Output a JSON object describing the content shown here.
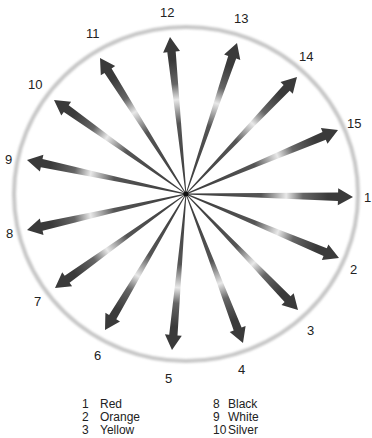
{
  "diagram": {
    "type": "radial-arrow-wheel",
    "center": [
      186,
      194
    ],
    "circle": {
      "rx": 172,
      "ry": 167,
      "stroke": "#c8c8c8"
    },
    "arrow_color": "#3a3a3a",
    "highlight_color": "#e8e8e8",
    "arrows": [
      {
        "number": "1",
        "tip": [
          353,
          197
        ],
        "label_pos": [
          364,
          202
        ]
      },
      {
        "number": "2",
        "tip": [
          339,
          258
        ],
        "label_pos": [
          350,
          274
        ]
      },
      {
        "number": "3",
        "tip": [
          298,
          310
        ],
        "label_pos": [
          307,
          335
        ]
      },
      {
        "number": "4",
        "tip": [
          243,
          343
        ],
        "label_pos": [
          238,
          374
        ]
      },
      {
        "number": "5",
        "tip": [
          172,
          350
        ],
        "label_pos": [
          165,
          383
        ]
      },
      {
        "number": "6",
        "tip": [
          105,
          330
        ],
        "label_pos": [
          94,
          360
        ]
      },
      {
        "number": "7",
        "tip": [
          55,
          288
        ],
        "label_pos": [
          34,
          306
        ]
      },
      {
        "number": "8",
        "tip": [
          27,
          230
        ],
        "label_pos": [
          6,
          238
        ]
      },
      {
        "number": "9",
        "tip": [
          27,
          160
        ],
        "label_pos": [
          5,
          164
        ]
      },
      {
        "number": "10",
        "tip": [
          54,
          100
        ],
        "label_pos": [
          28,
          89
        ]
      },
      {
        "number": "11",
        "tip": [
          100,
          58
        ],
        "label_pos": [
          86,
          38
        ]
      },
      {
        "number": "12",
        "tip": [
          170,
          37
        ],
        "label_pos": [
          160,
          17
        ]
      },
      {
        "number": "13",
        "tip": [
          237,
          43
        ],
        "label_pos": [
          234,
          23
        ]
      },
      {
        "number": "14",
        "tip": [
          297,
          77
        ],
        "label_pos": [
          299,
          61
        ]
      },
      {
        "number": "15",
        "tip": [
          338,
          130
        ],
        "label_pos": [
          347,
          128
        ]
      }
    ]
  },
  "legend": {
    "left": [
      {
        "num": "1",
        "label": "Red"
      },
      {
        "num": "2",
        "label": "Orange"
      },
      {
        "num": "3",
        "label": "Yellow"
      }
    ],
    "right": [
      {
        "num": "8",
        "label": "Black"
      },
      {
        "num": "9",
        "label": "White"
      },
      {
        "num": "10",
        "label": "Silver"
      }
    ]
  }
}
